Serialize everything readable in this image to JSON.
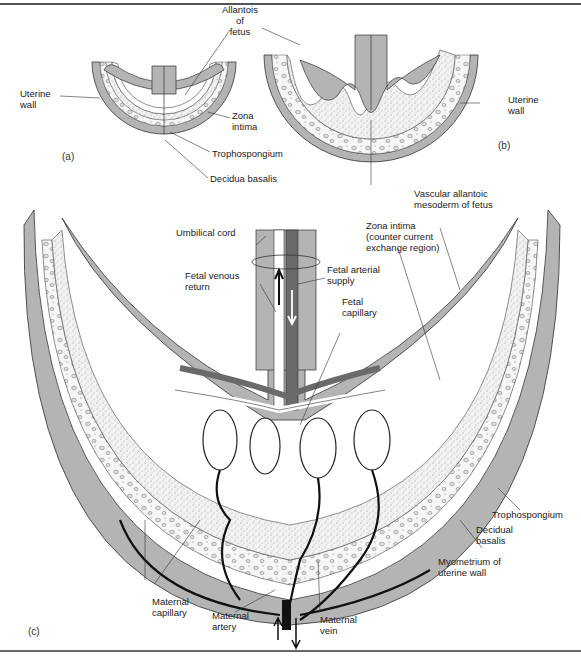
{
  "figure": {
    "colors": {
      "tissue_gray": "#b4b4b4",
      "fetal_vessel_dark": "#6a6a6a",
      "maternal_vessel_black": "#111111",
      "stipple_bg": "#ececec",
      "outline": "#333333"
    },
    "panels": {
      "a": {
        "id": "(a)",
        "labels": {
          "uterine_wall": "Uterine\nwall",
          "allantois": "Allantois\nof\nfetus",
          "zona_intima": "Zona\nintima",
          "trophospongium": "Trophospongium",
          "decidua_basalis": "Decidua basalis"
        }
      },
      "b": {
        "id": "(b)",
        "labels": {
          "uterine_wall": "Uterine\nwall"
        }
      },
      "c": {
        "id": "(c)",
        "labels": {
          "umbilical_cord": "Umbilical cord",
          "fetal_venous_return": "Fetal venous\nreturn",
          "fetal_arterial_supply": "Fetal arterial\nsupply",
          "fetal_capillary": "Fetal\ncapillary",
          "vascular_allantoic": "Vascular allantoic\nmesoderm of fetus",
          "zona_intima": "Zona intima\n(counter current\nexchange region)",
          "trophospongium": "Trophospongium",
          "decidual_basalis": "Decidual\nbasalis",
          "myometrium": "Myometrium of\nuterine wall",
          "maternal_capillary": "Maternal\ncapillary",
          "maternal_artery": "Maternal\nartery",
          "maternal_vein": "Maternal\nvein"
        }
      }
    }
  }
}
